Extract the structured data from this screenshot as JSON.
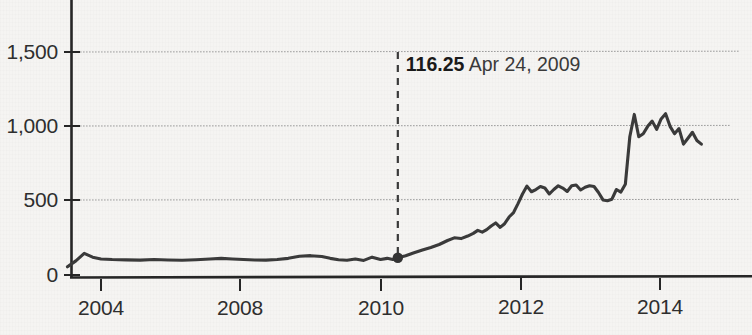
{
  "chart_data": {
    "type": "line",
    "title": "",
    "subtitle": "",
    "xlabel": "",
    "ylabel": "",
    "grid": true,
    "legend_position": "none",
    "xlim": [
      2003.3,
      2014.9
    ],
    "ylim": [
      0,
      1650
    ],
    "y_ticks": [
      0,
      500,
      1000,
      1500
    ],
    "y_tick_labels": [
      "0",
      "500",
      "1,000",
      "1,500"
    ],
    "x_ticks": [
      2004,
      2008,
      2010,
      2012,
      2014
    ],
    "x_tick_labels": [
      "2004",
      "2008",
      "2010",
      "2012",
      "2014"
    ],
    "series": [
      {
        "name": "price",
        "color": "#3a3a3a",
        "x": [
          2003.4,
          2003.55,
          2003.7,
          2003.85,
          2004.0,
          2004.2,
          2004.45,
          2004.7,
          2004.95,
          2005.2,
          2005.45,
          2005.7,
          2005.95,
          2006.15,
          2006.35,
          2006.55,
          2006.75,
          2006.95,
          2007.15,
          2007.35,
          2007.55,
          2007.75,
          2007.95,
          2008.1,
          2008.25,
          2008.4,
          2008.55,
          2008.7,
          2008.85,
          2009.0,
          2009.12,
          2009.22,
          2009.31,
          2009.45,
          2009.6,
          2009.75,
          2009.9,
          2010.05,
          2010.2,
          2010.32,
          2010.44,
          2010.56,
          2010.66,
          2010.74,
          2010.82,
          2010.9,
          2010.98,
          2011.06,
          2011.14,
          2011.22,
          2011.3,
          2011.38,
          2011.46,
          2011.54,
          2011.62,
          2011.7,
          2011.78,
          2011.86,
          2011.94,
          2012.02,
          2012.1,
          2012.18,
          2012.26,
          2012.34,
          2012.42,
          2012.5,
          2012.58,
          2012.66,
          2012.74,
          2012.82,
          2012.9,
          2012.98,
          2013.06,
          2013.14,
          2013.22,
          2013.3,
          2013.38,
          2013.46,
          2013.54,
          2013.62,
          2013.7,
          2013.78,
          2013.86,
          2013.94,
          2014.02,
          2014.1,
          2014.18,
          2014.26,
          2014.34,
          2014.42,
          2014.5,
          2014.58,
          2014.66,
          2014.74
        ],
        "y": [
          55,
          95,
          145,
          120,
          108,
          104,
          102,
          100,
          104,
          101,
          99,
          103,
          108,
          112,
          108,
          104,
          101,
          100,
          104,
          112,
          126,
          130,
          124,
          112,
          103,
          99,
          108,
          98,
          120,
          104,
          112,
          104,
          116,
          130,
          150,
          168,
          185,
          205,
          232,
          250,
          245,
          262,
          280,
          300,
          288,
          305,
          330,
          350,
          320,
          345,
          390,
          420,
          480,
          545,
          598,
          560,
          575,
          595,
          585,
          545,
          575,
          600,
          585,
          562,
          600,
          605,
          572,
          590,
          600,
          595,
          555,
          505,
          500,
          510,
          575,
          558,
          610,
          930,
          1080,
          930,
          950,
          1000,
          1035,
          980,
          1050,
          1085,
          1000,
          950,
          985,
          880,
          920,
          960,
          905,
          880
        ],
        "marker_point": {
          "x": 2009.31,
          "y": 116.25
        }
      }
    ],
    "annotations": [
      {
        "name": "marker-callout",
        "value": "116.25",
        "date": "Apr 24, 2009",
        "x": 2009.31,
        "y": 116.25,
        "dash_top_value": 1500
      }
    ]
  },
  "colors": {
    "line": "#3a3a3a",
    "grid": "#9a9a9a",
    "axis": "#2a2a2a",
    "background": "#f5f4f2",
    "text": "#2e2e2e",
    "annotation_bold": "#1a1a1a"
  }
}
